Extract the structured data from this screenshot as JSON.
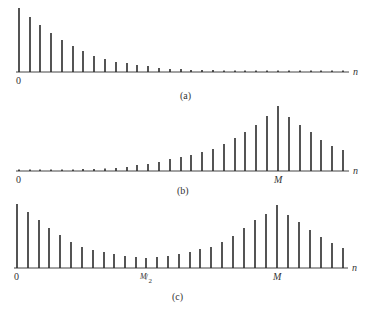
{
  "panels": [
    {
      "id": "a",
      "caption": "(a)",
      "baseline_y": 72,
      "axis_x_start": 16,
      "axis_x_end": 349,
      "origin_label": "0",
      "axis_label": "n",
      "tick_labels": [],
      "stems": [
        {
          "x": 19,
          "h": 64
        },
        {
          "x": 30,
          "h": 55
        },
        {
          "x": 40,
          "h": 47
        },
        {
          "x": 51,
          "h": 39
        },
        {
          "x": 62,
          "h": 32
        },
        {
          "x": 73,
          "h": 26
        },
        {
          "x": 83,
          "h": 21
        },
        {
          "x": 94,
          "h": 16
        },
        {
          "x": 105,
          "h": 13
        },
        {
          "x": 116,
          "h": 10
        },
        {
          "x": 127,
          "h": 9
        },
        {
          "x": 137,
          "h": 7
        },
        {
          "x": 148,
          "h": 6
        },
        {
          "x": 159,
          "h": 4
        },
        {
          "x": 170,
          "h": 3
        },
        {
          "x": 181,
          "h": 3
        },
        {
          "x": 191,
          "h": 2
        },
        {
          "x": 202,
          "h": 2
        },
        {
          "x": 213,
          "h": 2
        },
        {
          "x": 224,
          "h": 1.5
        },
        {
          "x": 235,
          "h": 1.5
        },
        {
          "x": 245,
          "h": 1.5
        },
        {
          "x": 256,
          "h": 1.5
        },
        {
          "x": 267,
          "h": 1.5
        },
        {
          "x": 278,
          "h": 1.5
        },
        {
          "x": 289,
          "h": 1.5
        },
        {
          "x": 300,
          "h": 1.5
        },
        {
          "x": 311,
          "h": 1.5
        },
        {
          "x": 321,
          "h": 1.5
        },
        {
          "x": 332,
          "h": 1.5
        },
        {
          "x": 343,
          "h": 1.5
        }
      ]
    },
    {
      "id": "b",
      "caption": "(b)",
      "baseline_y": 171,
      "axis_x_start": 16,
      "axis_x_end": 349,
      "origin_label": "0",
      "axis_label": "n",
      "tick_labels": [
        {
          "x": 278,
          "text": "M"
        }
      ],
      "stems": [
        {
          "x": 19,
          "h": 1.5
        },
        {
          "x": 30,
          "h": 1.5
        },
        {
          "x": 40,
          "h": 1.5
        },
        {
          "x": 51,
          "h": 1.5
        },
        {
          "x": 62,
          "h": 1.5
        },
        {
          "x": 73,
          "h": 1.5
        },
        {
          "x": 83,
          "h": 2
        },
        {
          "x": 94,
          "h": 2
        },
        {
          "x": 105,
          "h": 2.5
        },
        {
          "x": 116,
          "h": 3
        },
        {
          "x": 127,
          "h": 4
        },
        {
          "x": 137,
          "h": 6
        },
        {
          "x": 148,
          "h": 7
        },
        {
          "x": 159,
          "h": 9
        },
        {
          "x": 170,
          "h": 12
        },
        {
          "x": 181,
          "h": 14
        },
        {
          "x": 191,
          "h": 16
        },
        {
          "x": 202,
          "h": 19
        },
        {
          "x": 213,
          "h": 22
        },
        {
          "x": 224,
          "h": 27
        },
        {
          "x": 235,
          "h": 33
        },
        {
          "x": 245,
          "h": 39
        },
        {
          "x": 256,
          "h": 46
        },
        {
          "x": 267,
          "h": 55
        },
        {
          "x": 278,
          "h": 65
        },
        {
          "x": 289,
          "h": 54
        },
        {
          "x": 300,
          "h": 46
        },
        {
          "x": 311,
          "h": 39
        },
        {
          "x": 321,
          "h": 31
        },
        {
          "x": 332,
          "h": 25
        },
        {
          "x": 343,
          "h": 21
        }
      ]
    },
    {
      "id": "c",
      "caption": "(c)",
      "baseline_y": 268,
      "axis_x_start": 14,
      "axis_x_end": 348,
      "origin_label": "0",
      "axis_label": "n",
      "tick_labels": [
        {
          "x": 146,
          "text": "M/2"
        },
        {
          "x": 277,
          "text": "M"
        }
      ],
      "stems": [
        {
          "x": 17,
          "h": 64
        },
        {
          "x": 28,
          "h": 56
        },
        {
          "x": 39,
          "h": 48
        },
        {
          "x": 49,
          "h": 40
        },
        {
          "x": 60,
          "h": 33
        },
        {
          "x": 71,
          "h": 26
        },
        {
          "x": 82,
          "h": 21
        },
        {
          "x": 93,
          "h": 18
        },
        {
          "x": 104,
          "h": 16
        },
        {
          "x": 114,
          "h": 14
        },
        {
          "x": 125,
          "h": 12
        },
        {
          "x": 136,
          "h": 11
        },
        {
          "x": 146,
          "h": 10
        },
        {
          "x": 157,
          "h": 11
        },
        {
          "x": 168,
          "h": 12
        },
        {
          "x": 179,
          "h": 14
        },
        {
          "x": 190,
          "h": 16
        },
        {
          "x": 200,
          "h": 19
        },
        {
          "x": 211,
          "h": 21
        },
        {
          "x": 222,
          "h": 26
        },
        {
          "x": 233,
          "h": 32
        },
        {
          "x": 244,
          "h": 40
        },
        {
          "x": 255,
          "h": 48
        },
        {
          "x": 266,
          "h": 54
        },
        {
          "x": 277,
          "h": 63
        },
        {
          "x": 288,
          "h": 53
        },
        {
          "x": 299,
          "h": 46
        },
        {
          "x": 310,
          "h": 38
        },
        {
          "x": 321,
          "h": 31
        },
        {
          "x": 332,
          "h": 25
        },
        {
          "x": 343,
          "h": 20
        }
      ]
    }
  ],
  "captions": {
    "a": "(a)",
    "b": "(b)",
    "c": "(c)"
  },
  "labels": {
    "zero": "0",
    "n": "n",
    "M": "M",
    "M_half_num": "M",
    "M_half_den": "2"
  }
}
